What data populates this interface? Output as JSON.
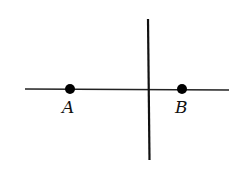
{
  "diagram": {
    "horizontal_line": {
      "x1": 25,
      "y1": 89,
      "x2": 229,
      "y2": 90
    },
    "vertical_line": {
      "x1": 148,
      "y1": 19,
      "x2": 149,
      "y2": 160
    },
    "points": [
      {
        "label": "A",
        "x": 70,
        "y": 89
      },
      {
        "label": "B",
        "x": 182,
        "y": 89
      }
    ],
    "color": "#111111"
  }
}
